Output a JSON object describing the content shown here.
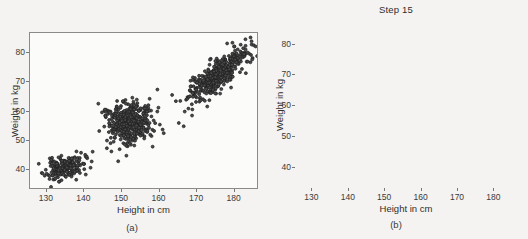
{
  "figure": {
    "background_color": "#f4f3f1",
    "marker_color": "#2b2b2b",
    "frame_color": "#8a8a8a"
  },
  "panels": [
    {
      "id": "a",
      "caption": "(a)",
      "title": "",
      "chart_index": 0
    },
    {
      "id": "b",
      "caption": "(b)",
      "title": "Step 15",
      "chart_index": 1
    }
  ],
  "chart_data": [
    {
      "type": "scatter",
      "title": "",
      "caption": "(a)",
      "xlabel": "Height in cm",
      "ylabel": "Weight in kg",
      "xlim": [
        125.5,
        186.5
      ],
      "ylim": [
        33.0,
        87.0
      ],
      "xticks": [
        130,
        140,
        150,
        160,
        170,
        180
      ],
      "yticks": [
        40,
        50,
        60,
        70,
        80
      ],
      "grid": false,
      "legend": false,
      "marker": {
        "shape": "circle",
        "size_px": 3.0,
        "edge_color": "#1f1f1f",
        "face_color": "#4a4a4a"
      },
      "clusters": [
        {
          "name": "cluster-low",
          "n": 190,
          "mean_x": 134.8,
          "mean_y": 40.0,
          "sd_x": 2.6,
          "sd_y": 2.1,
          "corr": 0.35,
          "seed": 11
        },
        {
          "name": "cluster-mid",
          "n": 430,
          "mean_x": 152.2,
          "mean_y": 55.6,
          "sd_x": 3.2,
          "sd_y": 3.5,
          "corr": 0.1,
          "seed": 27
        },
        {
          "name": "cluster-high",
          "n": 430,
          "mean_x": 176.0,
          "mean_y": 72.0,
          "sd_x": 3.9,
          "sd_y": 4.6,
          "corr": 0.8,
          "seed": 43
        }
      ],
      "outliers": [
        {
          "x": 183.4,
          "y": 84.8
        },
        {
          "x": 149.2,
          "y": 42.3
        },
        {
          "x": 166.8,
          "y": 54.5
        },
        {
          "x": 183.5,
          "y": 73.0
        }
      ]
    },
    {
      "type": "scatter",
      "title": "Step 15",
      "caption": "(b)",
      "xlabel": "Height in cm",
      "ylabel": "Weight in kg",
      "xlim": [
        125.5,
        186.5
      ],
      "ylim": [
        33.0,
        87.0
      ],
      "xticks": [
        130,
        140,
        150,
        160,
        170,
        180
      ],
      "yticks": [
        40,
        50,
        60,
        70,
        80
      ],
      "grid": false,
      "legend": false,
      "marker": {
        "shape": "circle",
        "size_px": 3.0,
        "edge_color": "#1f1f1f",
        "face_color": "#5a5a5a"
      },
      "clusters": [
        {
          "name": "cluster-low",
          "n": 210,
          "mean_x": 134.8,
          "mean_y": 40.2,
          "sd_x": 2.7,
          "sd_y": 2.2,
          "corr": 0.45,
          "seed": 61
        },
        {
          "name": "cluster-mid",
          "n": 440,
          "mean_x": 152.0,
          "mean_y": 55.2,
          "sd_x": 3.3,
          "sd_y": 3.8,
          "corr": 0.2,
          "seed": 73
        },
        {
          "name": "cluster-high",
          "n": 450,
          "mean_x": 176.2,
          "mean_y": 72.2,
          "sd_x": 3.8,
          "sd_y": 4.7,
          "corr": 0.82,
          "seed": 89
        }
      ],
      "outliers": [
        {
          "x": 184.0,
          "y": 84.5
        },
        {
          "x": 183.2,
          "y": 83.6
        },
        {
          "x": 160.6,
          "y": 54.6
        },
        {
          "x": 128.3,
          "y": 34.6
        },
        {
          "x": 131.0,
          "y": 34.4
        }
      ]
    }
  ]
}
